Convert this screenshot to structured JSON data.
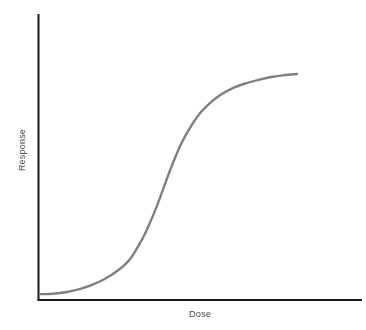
{
  "figure": {
    "background_color": "#ffffff",
    "axis_color": "#1a1a1a",
    "curve_color": "#808080"
  },
  "axes": {
    "x_label": "Dose",
    "y_label": "Response"
  },
  "chart_data": {
    "type": "line",
    "title": "",
    "subtitle": "",
    "xlabel": "Dose",
    "ylabel": "Response",
    "xlim": [
      0,
      1
    ],
    "ylim": [
      0,
      1
    ],
    "grid": false,
    "legend": null,
    "annotations": [],
    "xticks": [],
    "yticks": [],
    "xticklabels": [],
    "yticklabels": [],
    "series": [
      {
        "name": "dose-response",
        "color": "#808080",
        "linewidth": 2.4,
        "shape": "sigmoid",
        "x": [
          0.0,
          0.05,
          0.1,
          0.15,
          0.2,
          0.25,
          0.3,
          0.35,
          0.4,
          0.43,
          0.46,
          0.49,
          0.52,
          0.55,
          0.58,
          0.62,
          0.66,
          0.7,
          0.75,
          0.8,
          0.85,
          0.9,
          0.95,
          1.0
        ],
        "y": [
          0.012,
          0.014,
          0.02,
          0.032,
          0.05,
          0.075,
          0.11,
          0.16,
          0.25,
          0.32,
          0.4,
          0.49,
          0.575,
          0.65,
          0.71,
          0.775,
          0.82,
          0.855,
          0.885,
          0.905,
          0.92,
          0.932,
          0.94,
          0.945
        ]
      }
    ],
    "path_d": "M 40 296 C 62 296 74 292 88 284 C 108 273 126 250 140 216 C 150 192 155 176 162 162 C 170 146 180 125 196 108 C 212 91 232 79 252 72 C 268 66 284 63 297 62"
  }
}
